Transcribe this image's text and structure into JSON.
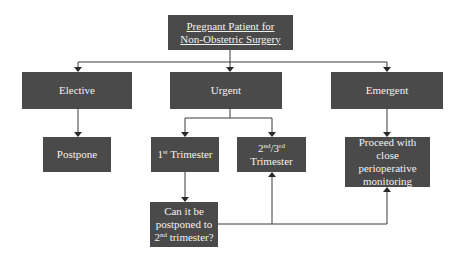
{
  "diagram": {
    "root": {
      "line1": "Pregnant Patient for",
      "line2": "Non-Obstetric Surgery"
    },
    "categories": {
      "elective": "Elective",
      "urgent": "Urgent",
      "emergent": "Emergent"
    },
    "outcomes": {
      "postpone": "Postpone",
      "first_trimester": {
        "num": "1",
        "sup": "st",
        "text": " Trimester"
      },
      "second_third_trimester": {
        "num1": "2",
        "sup1": "nd",
        "sep": "/",
        "num2": "3",
        "sup2": "rd",
        "line2": "Trimester"
      },
      "proceed": {
        "line1": "Proceed with close",
        "line2": "perioperative",
        "line3": "monitoring"
      }
    },
    "question": {
      "line1": "Can it be",
      "line2": "postponed to",
      "num": "2",
      "sup": "nd",
      "text": " trimester?"
    },
    "colors": {
      "box_fill": "#4a4a4a",
      "box_text": "#f2f2f2",
      "connector": "#3a3a3a"
    }
  }
}
